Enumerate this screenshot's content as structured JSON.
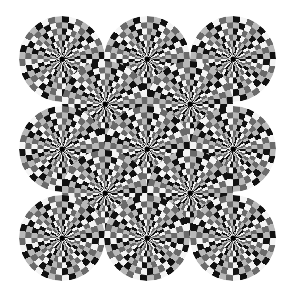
{
  "title": "Rotating snakes optical illusion",
  "colors": {
    "background": "#ffffff",
    "black": "#111111",
    "dark_gray": "#6a6a6a",
    "white": "#f4f4f4",
    "light_gray": "#b8b8b8"
  },
  "wheel_radius": 43,
  "segments": 36,
  "rings": 7,
  "wheels": [
    {
      "cx": 62,
      "cy": 59,
      "dir": 1
    },
    {
      "cx": 147,
      "cy": 59,
      "dir": -1
    },
    {
      "cx": 233,
      "cy": 59,
      "dir": 1
    },
    {
      "cx": 105,
      "cy": 104,
      "dir": -1
    },
    {
      "cx": 190,
      "cy": 104,
      "dir": 1
    },
    {
      "cx": 62,
      "cy": 149,
      "dir": -1
    },
    {
      "cx": 147,
      "cy": 149,
      "dir": 1
    },
    {
      "cx": 233,
      "cy": 149,
      "dir": -1
    },
    {
      "cx": 105,
      "cy": 193,
      "dir": 1
    },
    {
      "cx": 190,
      "cy": 193,
      "dir": -1
    },
    {
      "cx": 62,
      "cy": 238,
      "dir": 1
    },
    {
      "cx": 147,
      "cy": 238,
      "dir": -1
    },
    {
      "cx": 233,
      "cy": 238,
      "dir": 1
    }
  ]
}
